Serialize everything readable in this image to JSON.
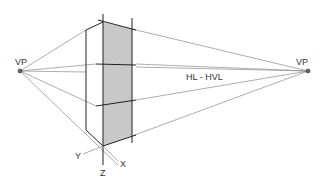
{
  "diagram": {
    "labels": {
      "vp_left": "VP",
      "vp_right": "VP",
      "horizon": "HL - HVL",
      "axis_x": "X",
      "axis_y": "Y",
      "axis_z": "Z"
    },
    "colors": {
      "background": "#ffffff",
      "construction_line": "#8a8a8a",
      "edge_line": "#222222",
      "panel_fill": "#c8c8c8"
    }
  }
}
